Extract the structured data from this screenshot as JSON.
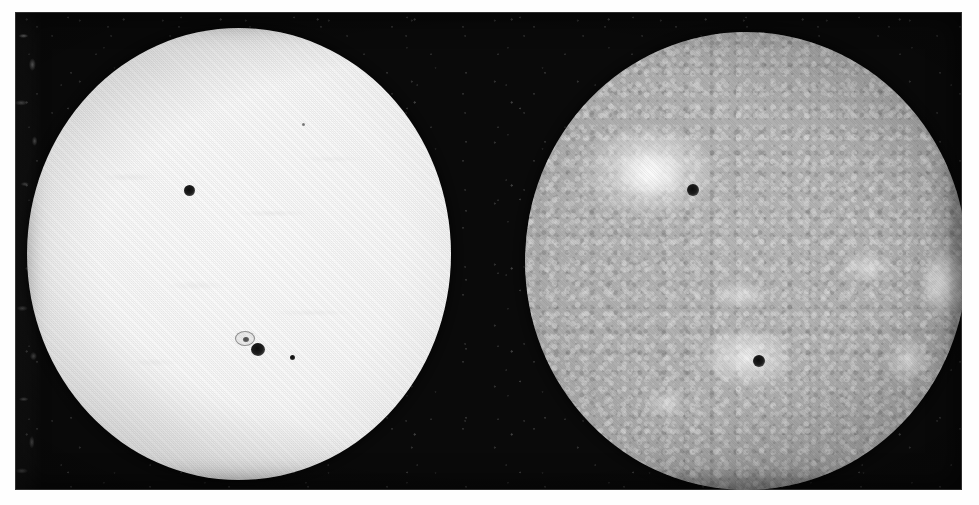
{
  "plate": {
    "caption": "",
    "background_color": "#ffffff",
    "emulsion_color": "#0a0a0a",
    "width_px": 979,
    "height_px": 505
  },
  "panels": [
    {
      "id": "photosphere",
      "label": "White-light photosphere",
      "medium": "white light (continuum)",
      "disk_color": "#fbfbfb",
      "limb_color": "#a8a8a8",
      "center_x": 224,
      "center_y": 254,
      "radius_x": 212,
      "radius_y": 226,
      "features": [
        {
          "kind": "sunspot",
          "name": "northern-sunspot",
          "x": 175,
          "y": 179,
          "size": 11
        },
        {
          "kind": "sunspot",
          "name": "main-sunspot-umbra",
          "x": 243,
          "y": 341,
          "size": 14
        },
        {
          "kind": "penumbra",
          "name": "sunspot-group-penumbra",
          "x": 228,
          "y": 327,
          "size": 17
        },
        {
          "kind": "sunspot",
          "name": "small-follower-spot",
          "x": 276,
          "y": 345,
          "size": 5
        },
        {
          "kind": "sunspot",
          "name": "faint-pore-upper-right",
          "x": 289,
          "y": 113,
          "size": 3
        }
      ]
    },
    {
      "id": "spectroheliogram",
      "label": "Calcium K spectroheliogram",
      "medium": "Ca II K line",
      "disk_color": "#b4b4b4",
      "limb_color": "#5a5a5a",
      "center_x": 731,
      "center_y": 249,
      "radius_x": 221,
      "radius_y": 229,
      "features": [
        {
          "kind": "plage",
          "name": "northern-plage-region",
          "x": 648,
          "y": 175,
          "w": 132,
          "h": 92
        },
        {
          "kind": "sunspot",
          "name": "northern-sunspot",
          "x": 678,
          "y": 184,
          "size": 12
        },
        {
          "kind": "plage",
          "name": "southern-plage-region",
          "x": 733,
          "y": 345,
          "w": 86,
          "h": 56
        },
        {
          "kind": "sunspot",
          "name": "southern-sunspot",
          "x": 744,
          "y": 349,
          "size": 12
        },
        {
          "kind": "plage",
          "name": "east-limb-plage",
          "x": 935,
          "y": 262,
          "w": 44,
          "h": 64
        },
        {
          "kind": "plage",
          "name": "central-filament-plage",
          "x": 742,
          "y": 283,
          "w": 52,
          "h": 26
        },
        {
          "kind": "plage",
          "name": "mid-right-plage",
          "x": 852,
          "y": 255,
          "w": 48,
          "h": 30
        },
        {
          "kind": "plage",
          "name": "lower-right-plage",
          "x": 896,
          "y": 352,
          "w": 42,
          "h": 40
        },
        {
          "kind": "plage",
          "name": "lower-left-plage",
          "x": 650,
          "y": 400,
          "w": 36,
          "h": 24
        }
      ]
    }
  ]
}
